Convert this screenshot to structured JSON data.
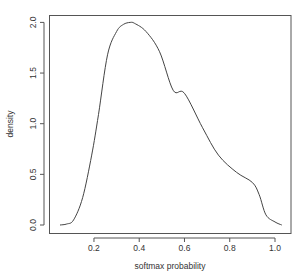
{
  "chart_data": {
    "type": "line",
    "title": "",
    "xlabel": "softmax probability",
    "ylabel": "density",
    "xlim": [
      0.0,
      1.05
    ],
    "ylim": [
      0.0,
      2.0
    ],
    "grid": false,
    "legend": null,
    "x_ticks": [
      "0.2",
      "0.4",
      "0.6",
      "0.8",
      "1.0"
    ],
    "y_ticks": [
      "0.0",
      "0.5",
      "1.0",
      "1.5",
      "2.0"
    ],
    "series": [
      {
        "name": "density",
        "x": [
          0.05,
          0.08,
          0.11,
          0.15,
          0.19,
          0.22,
          0.26,
          0.3,
          0.33,
          0.36,
          0.38,
          0.43,
          0.49,
          0.55,
          0.6,
          0.68,
          0.75,
          0.83,
          0.9,
          0.93,
          0.96,
          1.0,
          1.03
        ],
        "y": [
          0.0,
          0.01,
          0.05,
          0.27,
          0.69,
          1.09,
          1.68,
          1.91,
          1.98,
          2.0,
          1.99,
          1.91,
          1.71,
          1.33,
          1.3,
          0.96,
          0.69,
          0.52,
          0.42,
          0.3,
          0.1,
          0.03,
          0.0
        ]
      }
    ]
  }
}
